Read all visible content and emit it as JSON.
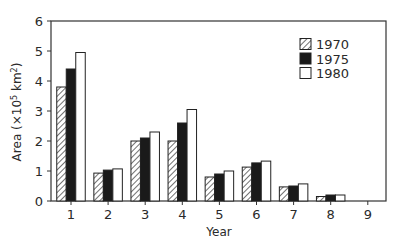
{
  "chart_data": {
    "type": "bar",
    "title": "",
    "xlabel": "Year",
    "ylabel": "Area (×10⁵ km²)",
    "ylabel_parts": {
      "main": "Area (×10",
      "exp1": "5",
      "mid": " km",
      "exp2": "2",
      "end": ")"
    },
    "categories": [
      "1",
      "2",
      "3",
      "4",
      "5",
      "6",
      "7",
      "8",
      "9"
    ],
    "series": [
      {
        "name": "1970",
        "fill": "hatch",
        "values": [
          3.8,
          0.93,
          2.0,
          2.0,
          0.8,
          1.13,
          0.47,
          0.15,
          0
        ]
      },
      {
        "name": "1975",
        "fill": "#1a1a1a",
        "values": [
          4.4,
          1.03,
          2.1,
          2.6,
          0.9,
          1.27,
          0.5,
          0.2,
          0
        ]
      },
      {
        "name": "1980",
        "fill": "#ffffff",
        "values": [
          4.95,
          1.07,
          2.3,
          3.05,
          1.0,
          1.33,
          0.57,
          0.2,
          0
        ]
      }
    ],
    "ylim": [
      0,
      6
    ],
    "yticks": [
      "0",
      "1",
      "2",
      "3",
      "4",
      "5",
      "6"
    ],
    "grid": false,
    "legend_position": "upper right",
    "frame": "box"
  }
}
